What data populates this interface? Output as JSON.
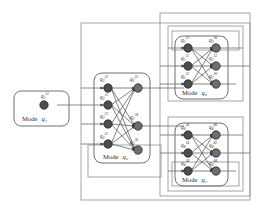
{
  "diagram": {
    "type": "hybrid-automaton-mode-graph",
    "title": "",
    "colors": {
      "node_fill": "#4d4d4d",
      "node_fill_light": "#7a7a7a",
      "node_stroke": "#1a1a1a",
      "edge": "#555555",
      "box_stroke": "#8a8a8a",
      "mode_box_stroke": "#707070",
      "background": "#ffffff",
      "text": "#2b2b2b"
    },
    "modes": [
      {
        "id": "mode1",
        "label_word": "Mode",
        "label_state": "q₁",
        "nodes_left": [
          {
            "base": "q",
            "sub": "1",
            "sup": "12"
          }
        ],
        "nodes_right": []
      },
      {
        "id": "mode2",
        "label_word": "Mode",
        "label_state": "q₂",
        "nodes_left": [
          {
            "base": "q",
            "sub": "2",
            "sup": "22"
          },
          {
            "base": "q",
            "sub": "2",
            "sup": "12"
          },
          {
            "base": "q",
            "sub": "2",
            "sup": "23"
          },
          {
            "base": "q",
            "sub": "2",
            "sup": "21"
          }
        ],
        "nodes_right": [
          {
            "base": "q",
            "sub": "2",
            "sup": "25"
          },
          {
            "base": "q",
            "sub": "2",
            "sup": "24"
          },
          {
            "base": "q",
            "sub": "2",
            "sup": "26"
          }
        ]
      },
      {
        "id": "mode3",
        "label_word": "Mode",
        "label_state": "q₃",
        "nodes_left": [
          {
            "base": "q",
            "sub": "3",
            "sup": "23"
          },
          {
            "base": "q",
            "sub": "3",
            "sup": "13"
          },
          {
            "base": "q",
            "sub": "3",
            "sup": "33"
          }
        ],
        "nodes_right": [
          {
            "base": "q",
            "sub": "3",
            "sup": "30"
          },
          {
            "base": "q",
            "sub": "3",
            "sup": "32"
          },
          {
            "base": "q",
            "sub": "3",
            "sup": "36"
          }
        ]
      },
      {
        "id": "mode4",
        "label_word": "Mode",
        "label_state": "q₄",
        "nodes_left": [
          {
            "base": "q",
            "sub": "4",
            "sup": "24"
          },
          {
            "base": "q",
            "sub": "4",
            "sup": "14"
          },
          {
            "base": "q",
            "sub": "4",
            "sup": "34"
          }
        ],
        "nodes_right": [
          {
            "base": "q",
            "sub": "4",
            "sup": "40"
          },
          {
            "base": "q",
            "sub": "4",
            "sup": "42"
          },
          {
            "base": "q",
            "sub": "4",
            "sup": "44"
          }
        ]
      }
    ],
    "routing_boxes": [
      {
        "name": "outer-left-channel"
      },
      {
        "name": "outer-right-channel"
      },
      {
        "name": "mode3-channel-outer"
      },
      {
        "name": "mode3-channel-inner"
      },
      {
        "name": "mode4-channel-outer"
      },
      {
        "name": "mode4-channel-inner"
      }
    ]
  }
}
